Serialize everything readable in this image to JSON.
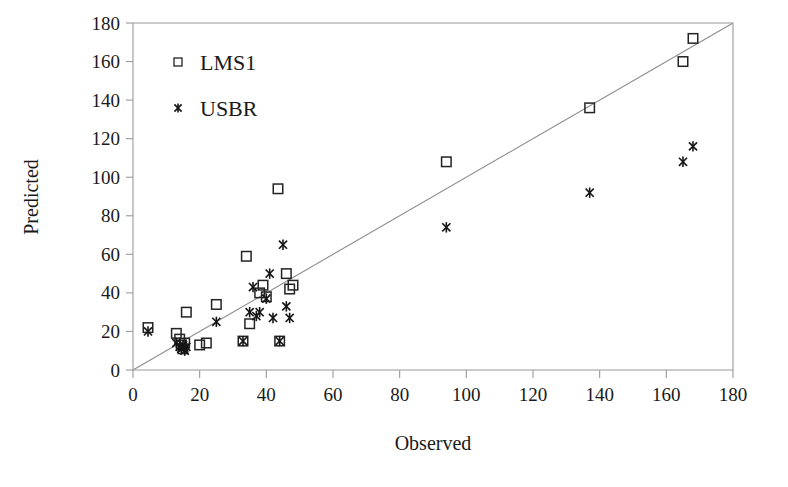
{
  "chart_data": {
    "type": "scatter",
    "title": "",
    "xlabel": "Observed",
    "ylabel": "Predicted",
    "xlim": [
      0,
      180
    ],
    "ylim": [
      0,
      180
    ],
    "xticks": [
      0,
      20,
      40,
      60,
      80,
      100,
      120,
      140,
      160,
      180
    ],
    "yticks": [
      0,
      20,
      40,
      60,
      80,
      100,
      120,
      140,
      160,
      180
    ],
    "grid": false,
    "legend_position": "upper-left-inside",
    "reference_line": {
      "label": "1:1 line",
      "from": [
        0,
        0
      ],
      "to": [
        180,
        180
      ]
    },
    "series": [
      {
        "name": "LMS1",
        "marker": "square",
        "points": [
          [
            4.5,
            22
          ],
          [
            13,
            19
          ],
          [
            14,
            16
          ],
          [
            14.5,
            13
          ],
          [
            15,
            11
          ],
          [
            15.5,
            14
          ],
          [
            16,
            30
          ],
          [
            20,
            13
          ],
          [
            22,
            14
          ],
          [
            25,
            34
          ],
          [
            33,
            15
          ],
          [
            34,
            59
          ],
          [
            35,
            24
          ],
          [
            38,
            40
          ],
          [
            39,
            44
          ],
          [
            40,
            38
          ],
          [
            43.5,
            94
          ],
          [
            44,
            15
          ],
          [
            46,
            50
          ],
          [
            47,
            42
          ],
          [
            48,
            44
          ],
          [
            94,
            108
          ],
          [
            137,
            136
          ],
          [
            165,
            160
          ],
          [
            168,
            172
          ]
        ]
      },
      {
        "name": "USBR",
        "marker": "star",
        "points": [
          [
            4.5,
            20
          ],
          [
            13,
            14
          ],
          [
            14,
            12
          ],
          [
            14.5,
            11
          ],
          [
            15,
            13
          ],
          [
            15.5,
            10
          ],
          [
            16,
            12
          ],
          [
            25,
            25
          ],
          [
            33,
            15
          ],
          [
            35,
            30
          ],
          [
            36,
            43
          ],
          [
            37,
            28
          ],
          [
            38,
            30
          ],
          [
            40,
            37
          ],
          [
            41,
            50
          ],
          [
            42,
            27
          ],
          [
            44,
            15
          ],
          [
            45,
            65
          ],
          [
            46,
            33
          ],
          [
            47,
            27
          ],
          [
            94,
            74
          ],
          [
            137,
            92
          ],
          [
            165,
            108
          ],
          [
            168,
            116
          ]
        ]
      }
    ]
  },
  "legend": {
    "entries": [
      {
        "label": "LMS1",
        "marker": "square"
      },
      {
        "label": "USBR",
        "marker": "star"
      }
    ]
  },
  "axes": {
    "x_title": "Observed",
    "y_title": "Predicted"
  }
}
